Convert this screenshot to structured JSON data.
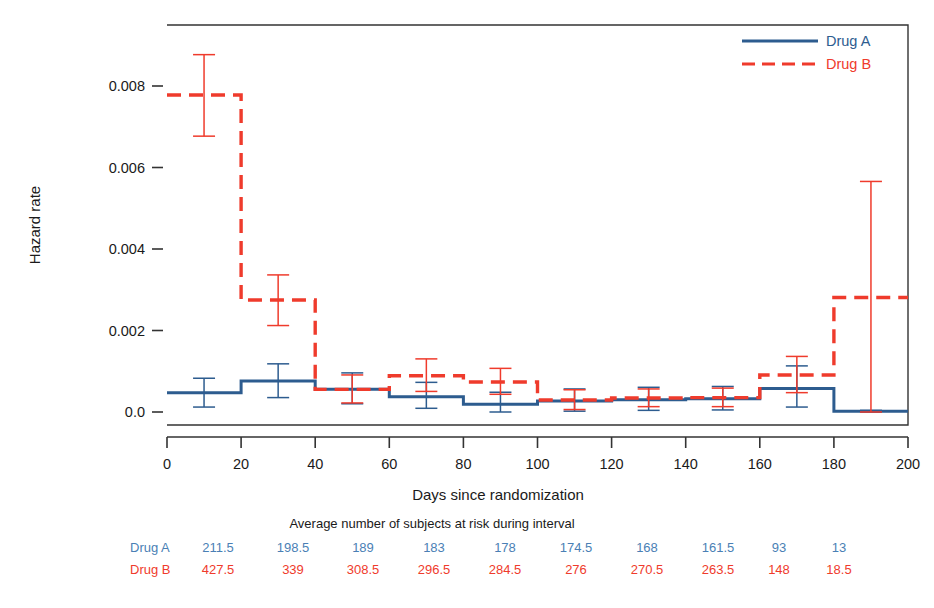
{
  "chart_data": {
    "type": "line",
    "subtype": "step-hazard-with-error-bars",
    "title": "",
    "xlabel": "Days since randomization",
    "ylabel": "Hazard rate",
    "xlim": [
      0,
      200
    ],
    "ylim": [
      0.0,
      0.0094
    ],
    "xticks": [
      0,
      20,
      40,
      60,
      80,
      100,
      120,
      140,
      160,
      180,
      200
    ],
    "xtick_labels": [
      "0",
      "20",
      "40",
      "60",
      "80",
      "100",
      "120",
      "140",
      "160",
      "180",
      "200"
    ],
    "yticks": [
      0.0,
      0.002,
      0.004,
      0.006,
      0.008
    ],
    "ytick_labels": [
      "0.0",
      "0.002",
      "0.004",
      "0.006",
      "0.008"
    ],
    "grid": false,
    "legend_position": "top-right",
    "interval_edges": [
      0,
      20,
      40,
      60,
      80,
      100,
      120,
      140,
      160,
      180,
      200
    ],
    "interval_midpoints": [
      10,
      30,
      50,
      70,
      90,
      110,
      130,
      150,
      170,
      190
    ],
    "series": [
      {
        "name": "Drug A",
        "color": "#2d5c8f",
        "linestyle": "solid",
        "values": [
          0.00047,
          0.00075,
          0.00055,
          0.00037,
          0.00019,
          0.00027,
          0.0003,
          0.00032,
          0.00057,
          2e-05
        ],
        "err_low": [
          0.00012,
          0.00035,
          0.0002,
          9e-05,
          0.0,
          2e-05,
          4e-05,
          5e-05,
          0.00012,
          0.0
        ],
        "err_high": [
          0.00082,
          0.00117,
          0.00095,
          0.00072,
          0.00048,
          0.00056,
          0.0006,
          0.00062,
          0.00112,
          4e-05
        ]
      },
      {
        "name": "Drug B",
        "color": "#ef3b2c",
        "linestyle": "dashed",
        "values": [
          0.0077,
          0.00272,
          0.00055,
          0.00088,
          0.00073,
          0.00029,
          0.00034,
          0.00035,
          0.0009,
          0.00278
        ],
        "err_low": [
          0.0067,
          0.0021,
          0.00022,
          0.0005,
          0.00043,
          6e-05,
          0.00013,
          0.00013,
          0.00047,
          0.0
        ],
        "err_high": [
          0.00868,
          0.00333,
          0.0009,
          0.00129,
          0.00106,
          0.00054,
          0.00056,
          0.00058,
          0.00135,
          0.0056
        ]
      }
    ]
  },
  "legend": {
    "entries": [
      {
        "label": "Drug A",
        "color": "#2d5c8f",
        "style": "solid"
      },
      {
        "label": "Drug B",
        "color": "#ef3b2c",
        "style": "dashed"
      }
    ]
  },
  "axes": {
    "y_title": "Hazard rate",
    "x_title": "Days since randomization"
  },
  "risk_table": {
    "title": "Average number of subjects at risk during interval",
    "rows": [
      {
        "label": "Drug A",
        "color": "#4a7fb5",
        "values": [
          "211.5",
          "198.5",
          "189",
          "183",
          "178",
          "174.5",
          "168",
          "161.5",
          "93",
          "13"
        ]
      },
      {
        "label": "Drug B",
        "color": "#ef3b2c",
        "values": [
          "427.5",
          "339",
          "308.5",
          "296.5",
          "284.5",
          "276",
          "270.5",
          "263.5",
          "148",
          "18.5"
        ]
      }
    ]
  },
  "colors": {
    "drug_a": "#2d5c8f",
    "drug_a_text": "#4a7fb5",
    "drug_b": "#ef3b2c",
    "axis": "#333333",
    "background": "#ffffff"
  }
}
